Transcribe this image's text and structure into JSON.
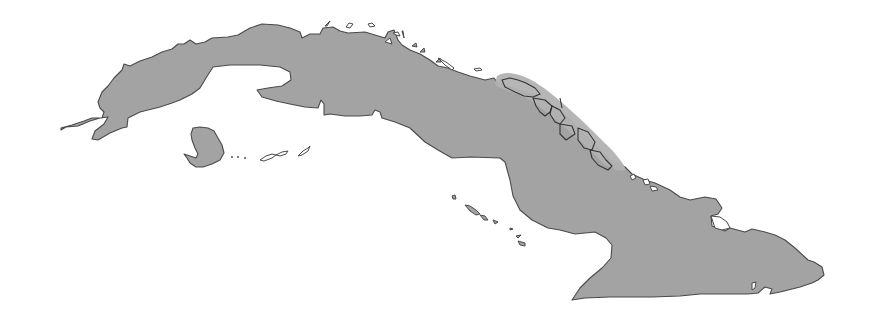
{
  "map": {
    "subject": "Cuba",
    "regions": [
      {
        "name": "main-island",
        "fill": "#a3a3a3",
        "stroke": "#4a4a4a"
      },
      {
        "name": "isla-de-la-juventud",
        "fill": "#a3a3a3",
        "stroke": "#4a4a4a"
      },
      {
        "name": "highlighted-north-cays",
        "fill": "#b2b2b2",
        "stroke": "#333333"
      }
    ],
    "background": "#ffffff",
    "labels": []
  }
}
